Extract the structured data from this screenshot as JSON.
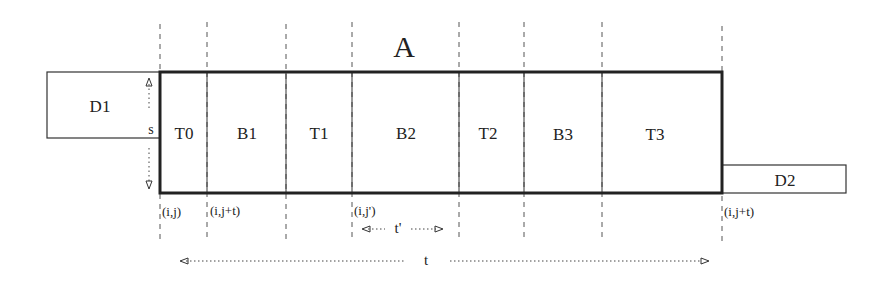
{
  "diagram": {
    "title": "A",
    "left_box": {
      "label": "D1"
    },
    "right_box": {
      "label": "D2"
    },
    "height_label": "s",
    "segments": [
      {
        "label": "T0"
      },
      {
        "label": "B1"
      },
      {
        "label": "T1"
      },
      {
        "label": "B2"
      },
      {
        "label": "T2"
      },
      {
        "label": "B3"
      },
      {
        "label": "T3"
      }
    ],
    "coordinates": [
      {
        "label": "(i,j)"
      },
      {
        "label": "(i,j+t)"
      },
      {
        "label": "(i,j')"
      },
      {
        "label": "(i,j+t)"
      }
    ],
    "inner_span_label": "t'",
    "total_span_label": "t",
    "colors": {
      "line": "#222222",
      "dash": "#555555",
      "background": "#ffffff"
    }
  }
}
